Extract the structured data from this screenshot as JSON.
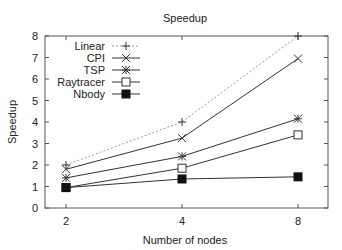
{
  "chart_data": {
    "type": "line",
    "title": "Speedup",
    "xlabel": "Number of nodes",
    "ylabel": "Speedup",
    "x": [
      2,
      4,
      8
    ],
    "xticks": [
      "2",
      "4",
      "8"
    ],
    "yticks": [
      "0",
      "1",
      "2",
      "3",
      "4",
      "5",
      "6",
      "7",
      "8"
    ],
    "ylim": [
      0,
      8
    ],
    "xscale": "log2",
    "grid": false,
    "legend_position": "top-left",
    "series": [
      {
        "name": "Linear",
        "values": [
          2,
          4,
          8
        ],
        "marker": "plus",
        "style": "dotted"
      },
      {
        "name": "CPI",
        "values": [
          1.8,
          3.25,
          6.95
        ],
        "marker": "x",
        "style": "solid"
      },
      {
        "name": "TSP",
        "values": [
          1.4,
          2.4,
          4.15
        ],
        "marker": "star",
        "style": "solid"
      },
      {
        "name": "Raytracer",
        "values": [
          0.95,
          1.85,
          3.4
        ],
        "marker": "open-square",
        "style": "solid"
      },
      {
        "name": "Nbody",
        "values": [
          0.95,
          1.35,
          1.45
        ],
        "marker": "filled-square",
        "style": "solid"
      }
    ]
  }
}
